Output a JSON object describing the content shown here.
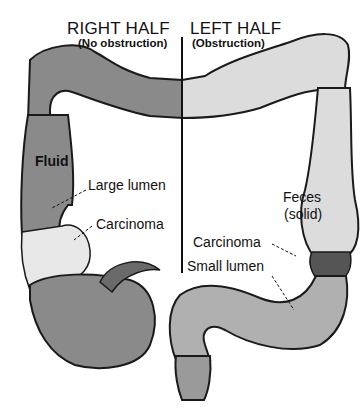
{
  "headers": {
    "right": {
      "title": "RIGHT HALF",
      "subtitle": "(No obstruction)"
    },
    "left": {
      "title": "LEFT HALF",
      "subtitle": "(Obstruction)"
    }
  },
  "labels": {
    "fluid": "Fluid",
    "large_lumen": "Large lumen",
    "carcinoma_right": "Carcinoma",
    "feces": "Feces",
    "feces_state": "(solid)",
    "carcinoma_left": "Carcinoma",
    "small_lumen": "Small lumen"
  },
  "colors": {
    "right_colon_fill": "#8a8a8a",
    "left_colon_fill": "#dcdcdc",
    "outline": "#1a1a1a",
    "tumor_fill": "#e8e8e8",
    "rectum_fill": "#9a9a9a"
  }
}
